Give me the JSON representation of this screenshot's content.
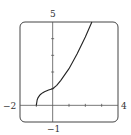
{
  "chart_data": {
    "type": "line",
    "title": "",
    "xlabel": "",
    "ylabel": "",
    "xlim": [
      -2,
      4
    ],
    "ylim": [
      -1,
      5
    ],
    "grid": false,
    "legend": null,
    "window_labels": {
      "xmin": "−2",
      "xmax": "4",
      "ymin": "−1",
      "ymax": "5"
    },
    "x_ticks": [
      -1,
      1,
      2,
      3
    ],
    "y_ticks": [
      1,
      2,
      3,
      4
    ],
    "series": [
      {
        "name": "f(x)",
        "x": [
          -1,
          -0.95,
          -0.9,
          -0.8,
          -0.75,
          -0.6,
          -0.5,
          -0.25,
          0,
          0.25,
          0.5,
          1,
          1.5,
          2,
          2.4
        ],
        "y": [
          0,
          0.32,
          0.45,
          0.6,
          0.65,
          0.76,
          0.82,
          0.92,
          1.0,
          1.2,
          1.5,
          2.2,
          3.1,
          4.1,
          5.0
        ]
      }
    ]
  },
  "colors": {
    "curve": "#222222",
    "axes": "#555555",
    "frame": "#444444"
  }
}
